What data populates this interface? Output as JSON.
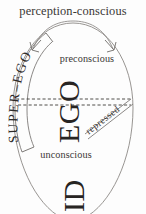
{
  "diagram": {
    "title": "perception-conscious",
    "canvas": {
      "width": 146,
      "height": 214,
      "background": "#fdfdfd"
    },
    "labels": {
      "perception_conscious": "perception-conscious",
      "preconscious": "preconscious",
      "unconscious": "unconscious",
      "super_ego": "SUPER–EGO",
      "ego": "EGO",
      "id": "ID",
      "repressed": "repressed"
    },
    "colors": {
      "ink_dark": "#272422",
      "ink_text": "#3a3735",
      "outline": "#8c8986",
      "dashed": "#3d3a37",
      "background": "#fdfdfd"
    },
    "regions": [
      {
        "name": "perception-conscious",
        "label": "perception-conscious",
        "position": "top-outside"
      },
      {
        "name": "preconscious",
        "label": "preconscious",
        "position": "upper-interior"
      },
      {
        "name": "unconscious",
        "label": "unconscious",
        "position": "lower-interior"
      }
    ],
    "structures": [
      {
        "name": "super-ego",
        "label": "SUPER–EGO",
        "orientation": "curved-left-arc"
      },
      {
        "name": "ego",
        "label": "EGO",
        "orientation": "rotated-90-ccw"
      },
      {
        "name": "id",
        "label": "ID",
        "orientation": "rotated-90-ccw"
      },
      {
        "name": "repressed",
        "label": "repressed",
        "orientation": "diagonal-band"
      }
    ]
  }
}
